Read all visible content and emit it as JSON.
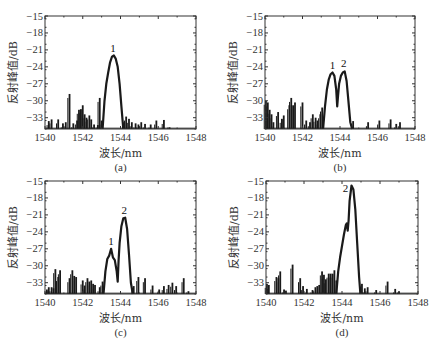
{
  "figure": {
    "xlabel": "波长/nm",
    "ylabel": "反射峰值/dB"
  },
  "chart_data": [
    {
      "type": "line",
      "panel": "(a)",
      "xlabel": "波长/nm",
      "ylabel": "反射峰值/dB",
      "xlim": [
        1540,
        1548
      ],
      "ylim": [
        -35,
        -15
      ],
      "xticks": [
        1540,
        1542,
        1544,
        1546,
        1548
      ],
      "yticks": [
        -15,
        -18,
        -21,
        -24,
        -27,
        -30,
        -33
      ],
      "grid": false,
      "peaks": [
        {
          "label": "1",
          "x": 1543.6,
          "y": -22
        }
      ],
      "main_curve": [
        [
          1543.05,
          -35
        ],
        [
          1543.15,
          -30
        ],
        [
          1543.25,
          -27
        ],
        [
          1543.35,
          -25
        ],
        [
          1543.45,
          -23.2
        ],
        [
          1543.55,
          -22.2
        ],
        [
          1543.65,
          -22
        ],
        [
          1543.75,
          -22.6
        ],
        [
          1543.85,
          -24
        ],
        [
          1543.95,
          -27
        ],
        [
          1544.05,
          -31
        ],
        [
          1544.15,
          -35
        ]
      ],
      "noise_spikes": [
        [
          1540.2,
          -33.6
        ],
        [
          1540.35,
          -33.3
        ],
        [
          1540.7,
          -33.3
        ],
        [
          1540.95,
          -34
        ],
        [
          1541.1,
          -33.8
        ],
        [
          1541.3,
          -28.8
        ],
        [
          1541.5,
          -34
        ],
        [
          1541.7,
          -33.5
        ],
        [
          1541.8,
          -31.6
        ],
        [
          1541.9,
          -31.5
        ],
        [
          1542.0,
          -30.8
        ],
        [
          1542.1,
          -32.4
        ],
        [
          1542.2,
          -33
        ],
        [
          1542.35,
          -32.6
        ],
        [
          1542.45,
          -33.3
        ],
        [
          1542.6,
          -34.2
        ],
        [
          1542.8,
          -34.3
        ],
        [
          1542.9,
          -29.5
        ],
        [
          1543.0,
          -33.5
        ],
        [
          1544.2,
          -33.8
        ],
        [
          1544.3,
          -32.8
        ],
        [
          1544.45,
          -33.2
        ],
        [
          1544.6,
          -33.8
        ],
        [
          1544.8,
          -34
        ],
        [
          1544.95,
          -34.2
        ],
        [
          1545.1,
          -33.8
        ],
        [
          1545.3,
          -34.1
        ],
        [
          1545.6,
          -34.2
        ],
        [
          1545.9,
          -33.5
        ],
        [
          1546.3,
          -33.4
        ],
        [
          1546.6,
          -34.7
        ]
      ]
    },
    {
      "type": "line",
      "panel": "(b)",
      "xlabel": "波长/nm",
      "ylabel": "反射峰值/dB",
      "xlim": [
        1540,
        1548
      ],
      "ylim": [
        -35,
        -15
      ],
      "xticks": [
        1540,
        1542,
        1544,
        1546,
        1548
      ],
      "yticks": [
        -15,
        -18,
        -21,
        -24,
        -27,
        -30,
        -33
      ],
      "grid": false,
      "peaks": [
        {
          "label": "1",
          "x": 1543.6,
          "y": -25
        },
        {
          "label": "2",
          "x": 1544.2,
          "y": -24.8
        }
      ],
      "main_curve": [
        [
          1543.1,
          -35
        ],
        [
          1543.2,
          -31
        ],
        [
          1543.3,
          -28
        ],
        [
          1543.4,
          -26.2
        ],
        [
          1543.5,
          -25.3
        ],
        [
          1543.6,
          -25
        ],
        [
          1543.7,
          -25.6
        ],
        [
          1543.8,
          -28
        ],
        [
          1543.85,
          -31
        ],
        [
          1543.9,
          -29
        ],
        [
          1543.95,
          -27
        ],
        [
          1544.05,
          -25.6
        ],
        [
          1544.15,
          -25
        ],
        [
          1544.25,
          -24.8
        ],
        [
          1544.35,
          -26.5
        ],
        [
          1544.45,
          -30
        ],
        [
          1544.55,
          -33.8
        ],
        [
          1544.65,
          -35
        ]
      ],
      "noise_spikes": [
        [
          1540.05,
          -30
        ],
        [
          1540.15,
          -30.3
        ],
        [
          1540.25,
          -31.6
        ],
        [
          1540.35,
          -32.4
        ],
        [
          1540.45,
          -33.8
        ],
        [
          1540.7,
          -32
        ],
        [
          1540.9,
          -33.2
        ],
        [
          1541.0,
          -32.6
        ],
        [
          1541.3,
          -30.8
        ],
        [
          1541.4,
          -29.5
        ],
        [
          1541.5,
          -30.8
        ],
        [
          1541.6,
          -30.3
        ],
        [
          1542.0,
          -30.3
        ],
        [
          1542.2,
          -33.5
        ],
        [
          1542.4,
          -33.8
        ],
        [
          1542.55,
          -32.4
        ],
        [
          1542.7,
          -33
        ],
        [
          1542.8,
          -33.5
        ],
        [
          1542.95,
          -32.4
        ],
        [
          1543.05,
          -31.2
        ],
        [
          1544.7,
          -33.6
        ],
        [
          1545.5,
          -33.8
        ],
        [
          1546.1,
          -33.5
        ],
        [
          1546.7,
          -33.3
        ],
        [
          1547.0,
          -34.1
        ],
        [
          1547.2,
          -33.8
        ]
      ]
    },
    {
      "type": "line",
      "panel": "(c)",
      "xlabel": "波长/nm",
      "ylabel": "反射峰值/dB",
      "xlim": [
        1540,
        1548
      ],
      "ylim": [
        -35,
        -15
      ],
      "xticks": [
        1540,
        1542,
        1544,
        1546,
        1548
      ],
      "yticks": [
        -15,
        -18,
        -21,
        -24,
        -27,
        -30,
        -33
      ],
      "grid": false,
      "peaks": [
        {
          "label": "1",
          "x": 1543.5,
          "y": -27
        },
        {
          "label": "2",
          "x": 1544.2,
          "y": -21.5
        }
      ],
      "main_curve": [
        [
          1543.1,
          -35
        ],
        [
          1543.2,
          -31
        ],
        [
          1543.3,
          -28.8
        ],
        [
          1543.4,
          -28.2
        ],
        [
          1543.5,
          -27
        ],
        [
          1543.6,
          -28.5
        ],
        [
          1543.7,
          -29
        ],
        [
          1543.8,
          -31
        ],
        [
          1543.85,
          -32.8
        ],
        [
          1543.9,
          -29
        ],
        [
          1543.95,
          -26
        ],
        [
          1544.05,
          -23
        ],
        [
          1544.15,
          -21.6
        ],
        [
          1544.25,
          -21.5
        ],
        [
          1544.35,
          -23.5
        ],
        [
          1544.45,
          -28
        ],
        [
          1544.55,
          -33
        ],
        [
          1544.65,
          -35
        ]
      ],
      "noise_spikes": [
        [
          1540.1,
          -34.2
        ],
        [
          1540.2,
          -33.8
        ],
        [
          1540.35,
          -33.8
        ],
        [
          1540.45,
          -34
        ],
        [
          1540.55,
          -30.6
        ],
        [
          1540.7,
          -32
        ],
        [
          1540.8,
          -30.8
        ],
        [
          1541.3,
          -32.2
        ],
        [
          1541.45,
          -30.8
        ],
        [
          1541.55,
          -31.8
        ],
        [
          1541.65,
          -32
        ],
        [
          1542.0,
          -32.6
        ],
        [
          1542.1,
          -33.5
        ],
        [
          1542.25,
          -32.2
        ],
        [
          1542.35,
          -32.8
        ],
        [
          1542.45,
          -32.6
        ],
        [
          1542.55,
          -33.2
        ],
        [
          1542.65,
          -33.4
        ],
        [
          1542.9,
          -33.8
        ],
        [
          1543.05,
          -32.8
        ],
        [
          1544.7,
          -33.6
        ],
        [
          1544.95,
          -32
        ],
        [
          1545.3,
          -32.2
        ],
        [
          1545.7,
          -33.5
        ],
        [
          1546.05,
          -34.2
        ],
        [
          1546.3,
          -33.6
        ],
        [
          1546.55,
          -33.4
        ],
        [
          1546.75,
          -33
        ],
        [
          1546.95,
          -33.6
        ],
        [
          1547.35,
          -32.2
        ],
        [
          1547.6,
          -34.5
        ]
      ]
    },
    {
      "type": "line",
      "panel": "(d)",
      "xlabel": "波长/nm",
      "ylabel": "反射峰值/dB",
      "xlim": [
        1540,
        1548
      ],
      "ylim": [
        -35,
        -15
      ],
      "xticks": [
        1540,
        1542,
        1544,
        1546,
        1548
      ],
      "yticks": [
        -15,
        -18,
        -21,
        -24,
        -27,
        -30,
        -33
      ],
      "grid": false,
      "peaks": [
        {
          "label": "2",
          "x": 1544.5,
          "y": -15.8
        }
      ],
      "main_curve": [
        [
          1543.7,
          -35
        ],
        [
          1543.8,
          -31
        ],
        [
          1543.9,
          -28.5
        ],
        [
          1544.0,
          -26.5
        ],
        [
          1544.1,
          -24.5
        ],
        [
          1544.2,
          -22.8
        ],
        [
          1544.25,
          -22.5
        ],
        [
          1544.3,
          -23.8
        ],
        [
          1544.35,
          -22
        ],
        [
          1544.4,
          -18.5
        ],
        [
          1544.5,
          -15.8
        ],
        [
          1544.6,
          -16.5
        ],
        [
          1544.7,
          -20
        ],
        [
          1544.8,
          -26
        ],
        [
          1544.9,
          -32
        ],
        [
          1544.97,
          -35
        ]
      ],
      "noise_spikes": [
        [
          1540.05,
          -33.2
        ],
        [
          1540.15,
          -33.4
        ],
        [
          1540.55,
          -32
        ],
        [
          1540.65,
          -32.2
        ],
        [
          1540.75,
          -31
        ],
        [
          1540.95,
          -34.2
        ],
        [
          1541.05,
          -34.4
        ],
        [
          1541.4,
          -29.8
        ],
        [
          1541.8,
          -32.2
        ],
        [
          1541.95,
          -33.6
        ],
        [
          1542.15,
          -34.1
        ],
        [
          1542.45,
          -34.3
        ],
        [
          1542.6,
          -33.8
        ],
        [
          1542.7,
          -33.6
        ],
        [
          1542.8,
          -33.4
        ],
        [
          1542.95,
          -31
        ],
        [
          1543.05,
          -31.6
        ],
        [
          1543.15,
          -32.4
        ],
        [
          1543.3,
          -31.4
        ],
        [
          1543.4,
          -31.4
        ],
        [
          1543.5,
          -31.4
        ],
        [
          1543.6,
          -30.8
        ],
        [
          1543.7,
          -32.6
        ],
        [
          1545.05,
          -33.2
        ],
        [
          1545.2,
          -34
        ],
        [
          1545.35,
          -33.8
        ],
        [
          1545.8,
          -34.3
        ],
        [
          1546.4,
          -32.8
        ],
        [
          1546.8,
          -34.1
        ],
        [
          1547.0,
          -34.5
        ]
      ]
    }
  ],
  "panels": [
    {
      "label": "(a)",
      "xlabel": "波长/nm",
      "ylabel": "反射峰值/dB"
    },
    {
      "label": "(b)",
      "xlabel": "波长/nm",
      "ylabel": "反射峰值/dB"
    },
    {
      "label": "(c)",
      "xlabel": "波长/nm",
      "ylabel": "反射峰值/dB"
    },
    {
      "label": "(d)",
      "xlabel": "波长/nm",
      "ylabel": "反射峰值/dB"
    }
  ],
  "style": {
    "line_color": "#1a1a1a",
    "axis_color": "#333333",
    "background": "#ffffff"
  }
}
